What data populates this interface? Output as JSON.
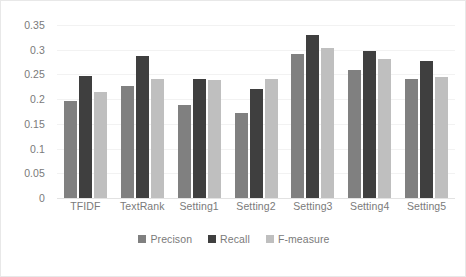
{
  "chart_data": {
    "type": "bar",
    "title": "",
    "xlabel": "",
    "ylabel": "",
    "ylim": [
      0,
      0.35
    ],
    "yticks": [
      "0",
      "0.05",
      "0.1",
      "0.15",
      "0.2",
      "0.25",
      "0.3",
      "0.35"
    ],
    "ytick_values": [
      0,
      0.05,
      0.1,
      0.15,
      0.2,
      0.25,
      0.3,
      0.35
    ],
    "grid": true,
    "legend_position": "bottom",
    "categories": [
      "TFIDF",
      "TextRank",
      "Setting1",
      "Setting2",
      "Setting3",
      "Setting4",
      "Setting5"
    ],
    "series": [
      {
        "name": "Precison",
        "color": "#808080",
        "values": [
          0.197,
          0.226,
          0.188,
          0.172,
          0.291,
          0.259,
          0.241
        ]
      },
      {
        "name": "Recall",
        "color": "#3f3f3f",
        "values": [
          0.247,
          0.287,
          0.24,
          0.221,
          0.33,
          0.297,
          0.278
        ]
      },
      {
        "name": "F-measure",
        "color": "#bfbfbf",
        "values": [
          0.215,
          0.24,
          0.239,
          0.241,
          0.303,
          0.281,
          0.245
        ]
      }
    ]
  }
}
